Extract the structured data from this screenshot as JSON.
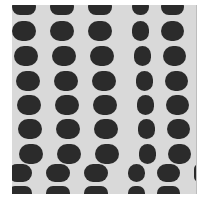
{
  "image": {
    "description": "Grayscale micrograph of a regular array of dark rounded-rectangle dots on a light gray background, with a horizontal offset discontinuity near the bottom",
    "colors": {
      "background": "#d9d9d9",
      "dot": "#2b2b2b",
      "page": "#ffffff"
    },
    "grid": {
      "rows": 9,
      "columns": 5,
      "note": "second-to-last row shifted left relative to rows above"
    }
  }
}
